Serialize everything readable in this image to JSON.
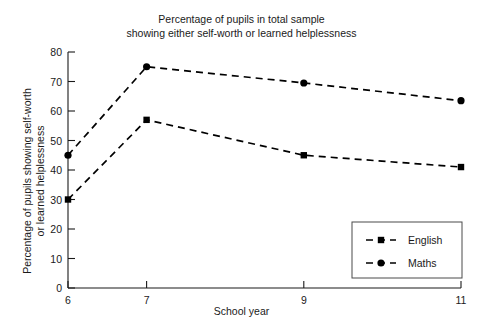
{
  "chart_data": {
    "type": "line",
    "title": "Percentage of pupils in total sample\nshowing either self-worth or learned helplessness",
    "xlabel": "School year",
    "ylabel": "Percentage of pupils showing self-worth\nor learned helplessness",
    "x": [
      6,
      7,
      9,
      11
    ],
    "xtick_labels": [
      "6",
      "7",
      "9",
      "11"
    ],
    "ytick_labels": [
      "0",
      "10",
      "20",
      "30",
      "40",
      "50",
      "60",
      "70",
      "80"
    ],
    "yticks": [
      0,
      10,
      20,
      30,
      40,
      50,
      60,
      70,
      80
    ],
    "ylim": [
      0,
      80
    ],
    "xlim": [
      6,
      11
    ],
    "grid": false,
    "legend_position": "lower right",
    "series": [
      {
        "name": "English",
        "marker": "square",
        "linestyle": "dashed",
        "color": "#000000",
        "values": [
          30,
          57,
          45,
          41
        ]
      },
      {
        "name": "Maths",
        "marker": "circle",
        "linestyle": "dashed",
        "color": "#000000",
        "values": [
          45,
          75,
          69.5,
          63.5
        ]
      }
    ]
  },
  "legend": {
    "entries": [
      {
        "label": "English"
      },
      {
        "label": "Maths"
      }
    ]
  }
}
